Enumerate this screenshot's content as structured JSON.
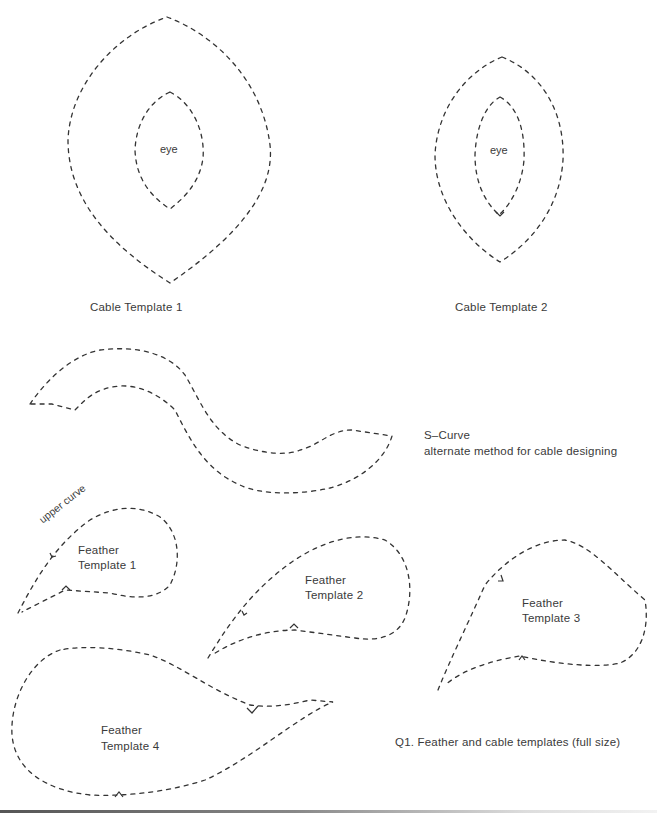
{
  "figure": {
    "caption": "Q1. Feather and cable templates (full size)"
  },
  "cable_templates": [
    {
      "name": "Cable Template 1",
      "inner_label": "eye"
    },
    {
      "name": "Cable Template 2",
      "inner_label": "eye"
    }
  ],
  "s_curve": {
    "title": "S–Curve",
    "subtitle": "alternate method for cable designing"
  },
  "feather_templates": [
    {
      "line1": "Feather",
      "line2": "Template 1",
      "annotation": "upper curve"
    },
    {
      "line1": "Feather",
      "line2": "Template 2"
    },
    {
      "line1": "Feather",
      "line2": "Template 3"
    },
    {
      "line1": "Feather",
      "line2": "Template 4"
    }
  ],
  "style": {
    "stroke_color": "#333333",
    "dash_pattern": "4 5"
  }
}
